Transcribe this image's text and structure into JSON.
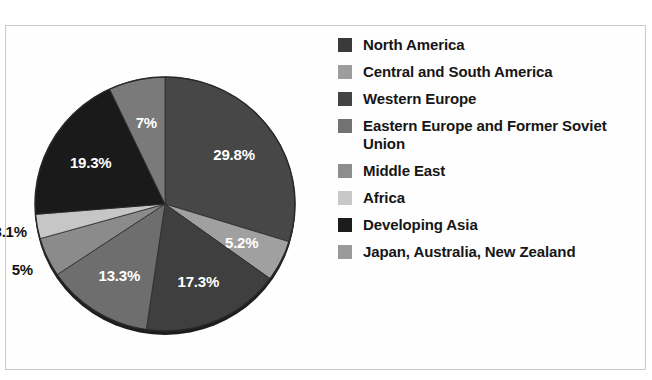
{
  "figure": {
    "title": "World Energy Consumption by Region",
    "title_truncated": true,
    "frame_color": "#c9c9c9",
    "background": "#ffffff"
  },
  "chart_data": {
    "type": "pie",
    "title": "World Energy Consumption by Region",
    "xlabel": "",
    "ylabel": "",
    "grid": false,
    "legend_position": "right",
    "start_angle_deg": 0,
    "direction": "clockwise",
    "units": "percent",
    "categories": [
      "North America",
      "Central and South America",
      "Western Europe",
      "Eastern Europe and Former Soviet Union",
      "Middle East",
      "Africa",
      "Developing Asia",
      "Japan, Australia, New Zealand"
    ],
    "values": [
      29.8,
      5.2,
      17.3,
      13.3,
      5.0,
      3.1,
      19.3,
      7.0
    ],
    "labels": [
      "29.8%",
      "5.2%",
      "17.3%",
      "13.3%",
      "5%",
      "3.1%",
      "19.3%",
      "7%"
    ],
    "colors": [
      "#474747",
      "#a0a0a0",
      "#3f3f3f",
      "#6e6e6e",
      "#8b8b8b",
      "#c6c6c6",
      "#1a1a1a",
      "#7a7a7a"
    ],
    "label_colors": [
      "#ffffff",
      "#ffffff",
      "#ffffff",
      "#ffffff",
      "#121212",
      "#121212",
      "#ffffff",
      "#ffffff"
    ],
    "label_placement": [
      "inside",
      "inside",
      "inside",
      "inside",
      "outside",
      "outside",
      "inside",
      "inside"
    ]
  },
  "legend": {
    "items": [
      {
        "label": "North America",
        "color": "#3a3a3a"
      },
      {
        "label": "Central and South America",
        "color": "#9d9d9d"
      },
      {
        "label": "Western Europe",
        "color": "#434343"
      },
      {
        "label": "Eastern Europe and Former Soviet Union",
        "color": "#727272"
      },
      {
        "label": "Middle East",
        "color": "#8d8d8d"
      },
      {
        "label": "Africa",
        "color": "#c8c8c8"
      },
      {
        "label": "Developing Asia",
        "color": "#1c1c1c"
      },
      {
        "label": "Japan, Australia, New Zealand",
        "color": "#9a9a9a"
      }
    ]
  }
}
